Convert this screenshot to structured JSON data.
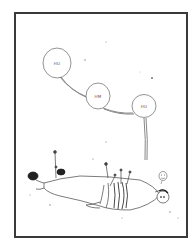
{
  "panel": {
    "border_color": "#3a3a3a",
    "background": "#ffffff"
  },
  "speech_bubbles": [
    {
      "text": "HU"
    },
    {
      "text": "HM"
    },
    {
      "text": "HU"
    }
  ],
  "thought_bubble": {
    "text": ""
  },
  "scene": {
    "description": "Figure lying on ground bound with straps, pinned by stakes, speaking in chain of bubbles",
    "ink_color": "#444444",
    "dark_ink": "#222222"
  }
}
